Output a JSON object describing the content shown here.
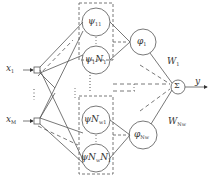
{
  "diagram": {
    "type": "wavelet-neural-network",
    "colors": {
      "stroke": "#555555",
      "text": "#333333",
      "background": "#ffffff"
    },
    "inputs": [
      {
        "id": "x1",
        "label": "x",
        "sub": "1"
      },
      {
        "id": "xM",
        "label": "x",
        "sub": "M"
      }
    ],
    "input_ellipsis": "⋮",
    "wavelon_groups": [
      {
        "id": "group-1",
        "top": {
          "label": "ψ",
          "sub": "11"
        },
        "bottom": {
          "label": "ψ",
          "sub": "1",
          "mid": "N",
          "tail": "1"
        },
        "ellipsis": "⋮"
      },
      {
        "id": "group-Nw",
        "top": {
          "label": "ψN",
          "sub": "w1"
        },
        "bottom": {
          "label": "ψN",
          "sub": "w",
          "mid": "N",
          "tail": "1"
        },
        "ellipsis": "⋮"
      }
    ],
    "group_ellipsis": "⋮",
    "product_nodes": [
      {
        "id": "phi-1",
        "label": "φ",
        "sub": "1"
      },
      {
        "id": "phi-Nw",
        "label": "φ",
        "sub": "Nw"
      }
    ],
    "weights": [
      {
        "id": "w1",
        "label": "W",
        "sub": "1"
      },
      {
        "id": "wNw",
        "label": "W",
        "sub": "Nw"
      }
    ],
    "sum_node": {
      "label": "Σ"
    },
    "output": {
      "label": "y"
    }
  }
}
